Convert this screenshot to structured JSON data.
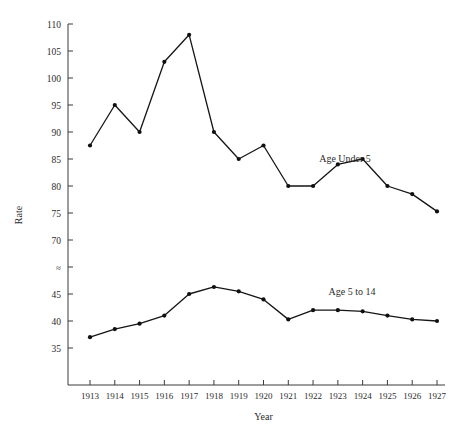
{
  "chart_data": {
    "type": "line",
    "title": "",
    "xlabel": "Year",
    "ylabel": "Rate",
    "x": [
      1913,
      1914,
      1915,
      1916,
      1917,
      1918,
      1919,
      1920,
      1921,
      1922,
      1923,
      1924,
      1925,
      1926,
      1927
    ],
    "xtick_labels": [
      "1913",
      "1914",
      "1915",
      "1916",
      "1917",
      "1918",
      "1919",
      "1920",
      "1921",
      "1922",
      "1923",
      "1924",
      "1925",
      "1926",
      "1927"
    ],
    "ytick_labels": [
      "110",
      "105",
      "100",
      "95",
      "90",
      "85",
      "80",
      "75",
      "70",
      "≈",
      "45",
      "40",
      "35"
    ],
    "ytick_values": [
      110,
      105,
      100,
      95,
      90,
      85,
      80,
      75,
      70,
      null,
      45,
      40,
      35
    ],
    "ylim": [
      35,
      110
    ],
    "axis_break": {
      "present": true,
      "symbol": "≈",
      "between": [
        70,
        45
      ]
    },
    "grid": false,
    "legend_position": "inline-annotation",
    "series": [
      {
        "name": "Age Under 5",
        "label": "Age Under 5",
        "values": [
          87.5,
          95.0,
          90.0,
          103.0,
          108.0,
          90.0,
          85.0,
          87.5,
          80.0,
          80.0,
          84.0,
          85.0,
          80.0,
          78.5,
          75.3
        ]
      },
      {
        "name": "Age 5 to 14",
        "label": "Age 5 to 14",
        "values": [
          37.0,
          38.5,
          39.5,
          41.0,
          45.0,
          46.3,
          45.5,
          44.0,
          40.3,
          42.0,
          42.0,
          41.8,
          41.0,
          40.3,
          40.0
        ]
      }
    ],
    "colors": {
      "line": "#151115",
      "marker": "#101010",
      "axis": "#3a3a3a",
      "background": "#ffffff"
    }
  }
}
